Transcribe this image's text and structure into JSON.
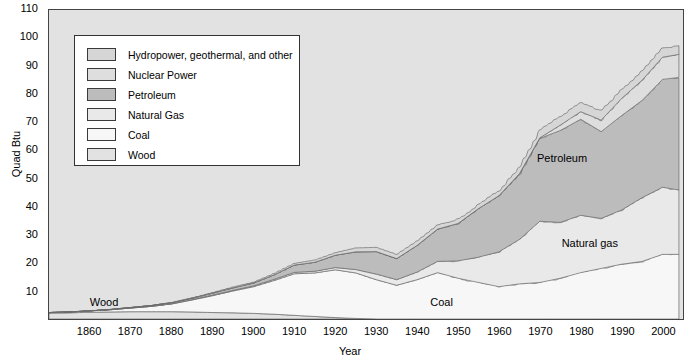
{
  "chart_data": {
    "type": "area",
    "stacked": true,
    "title": "",
    "xlabel": "Year",
    "ylabel": "Quad Btu",
    "xlim": [
      1850,
      2005
    ],
    "ylim": [
      0,
      110
    ],
    "ytick_labels": [
      "10",
      "20",
      "30",
      "40",
      "50",
      "60",
      "70",
      "80",
      "90",
      "100",
      "110"
    ],
    "ytick_values": [
      10,
      20,
      30,
      40,
      50,
      60,
      70,
      80,
      90,
      100,
      110
    ],
    "xtick_labels": [
      "1860",
      "1870",
      "1880",
      "1890",
      "1900",
      "1910",
      "1920",
      "1930",
      "1940",
      "1950",
      "1960",
      "1970",
      "1980",
      "1990",
      "2000"
    ],
    "xtick_values": [
      1860,
      1870,
      1880,
      1890,
      1900,
      1910,
      1920,
      1930,
      1940,
      1950,
      1960,
      1970,
      1980,
      1990,
      2000
    ],
    "grid": false,
    "legend_position": "upper-left-inside",
    "annotations": [
      {
        "text": "Petroleum",
        "x": 1976,
        "y": 57
      },
      {
        "text": "Natural gas",
        "x": 1982,
        "y": 27
      },
      {
        "text": "Coal",
        "x": 1950,
        "y": 6
      },
      {
        "text": "Wood",
        "x": 1867,
        "y": 6
      }
    ],
    "x": [
      1850,
      1855,
      1860,
      1865,
      1870,
      1875,
      1880,
      1885,
      1890,
      1895,
      1900,
      1905,
      1910,
      1915,
      1920,
      1925,
      1930,
      1935,
      1940,
      1945,
      1950,
      1955,
      1960,
      1965,
      1970,
      1975,
      1980,
      1985,
      1990,
      1995,
      2000,
      2004
    ],
    "series": [
      {
        "name": "Wood",
        "color": "#e2e2e2",
        "values": [
          2.1,
          2.2,
          2.4,
          2.5,
          2.6,
          2.6,
          2.6,
          2.5,
          2.3,
          2.2,
          2.0,
          1.7,
          1.3,
          0.9,
          0.5,
          0.2,
          0.0,
          0.0,
          0.0,
          0.0,
          0.0,
          0.0,
          0.0,
          0.0,
          0.0,
          0.0,
          0.0,
          0.0,
          0.0,
          0.0,
          0.0,
          0.0
        ]
      },
      {
        "name": "Coal",
        "color": "#f7f7f7",
        "values": [
          0.2,
          0.3,
          0.5,
          0.8,
          1.3,
          1.9,
          2.8,
          4.3,
          6.0,
          7.8,
          9.5,
          12.0,
          14.8,
          15.5,
          17.0,
          16.2,
          14.0,
          12.0,
          14.0,
          16.5,
          14.5,
          13.0,
          11.5,
          12.5,
          13.0,
          14.5,
          16.5,
          18.0,
          19.5,
          20.5,
          23.0,
          23.0
        ]
      },
      {
        "name": "Natural Gas",
        "color": "#e9e9e9",
        "values": [
          0.0,
          0.0,
          0.0,
          0.0,
          0.0,
          0.0,
          0.0,
          0.1,
          0.2,
          0.2,
          0.3,
          0.4,
          0.5,
          0.6,
          0.8,
          1.2,
          2.0,
          2.0,
          2.7,
          4.0,
          6.2,
          9.0,
          12.4,
          15.8,
          21.8,
          19.9,
          20.4,
          17.8,
          19.3,
          22.7,
          23.9,
          22.9
        ]
      },
      {
        "name": "Petroleum",
        "color": "#bcbcbc",
        "values": [
          0.0,
          0.0,
          0.0,
          0.1,
          0.2,
          0.3,
          0.4,
          0.5,
          0.7,
          0.9,
          1.0,
          1.6,
          2.6,
          3.2,
          4.4,
          6.3,
          8.0,
          7.5,
          9.5,
          11.5,
          13.3,
          17.3,
          19.9,
          23.2,
          29.5,
          32.7,
          34.2,
          30.9,
          33.6,
          34.6,
          38.4,
          40.1
        ]
      },
      {
        "name": "Nuclear Power",
        "color": "#dedede",
        "values": [
          0.0,
          0.0,
          0.0,
          0.0,
          0.0,
          0.0,
          0.0,
          0.0,
          0.0,
          0.0,
          0.0,
          0.0,
          0.0,
          0.0,
          0.0,
          0.0,
          0.0,
          0.0,
          0.0,
          0.0,
          0.0,
          0.0,
          0.1,
          0.2,
          0.2,
          1.9,
          2.7,
          4.1,
          6.1,
          7.2,
          7.9,
          8.2
        ]
      },
      {
        "name": "Hydropower, geothermal, and other",
        "color": "#d6d6d6",
        "values": [
          0.0,
          0.0,
          0.0,
          0.0,
          0.0,
          0.0,
          0.1,
          0.1,
          0.2,
          0.3,
          0.3,
          0.5,
          0.6,
          0.8,
          0.9,
          1.4,
          1.5,
          1.5,
          1.6,
          1.5,
          1.6,
          1.4,
          1.7,
          2.1,
          2.7,
          3.2,
          3.1,
          3.4,
          3.1,
          3.5,
          3.1,
          3.2
        ]
      }
    ],
    "totals_note": ""
  },
  "legend": {
    "items": [
      {
        "label": "Hydropower, geothermal, and other",
        "color": "#d6d6d6"
      },
      {
        "label": "Nuclear Power",
        "color": "#dedede"
      },
      {
        "label": "Petroleum",
        "color": "#bcbcbc"
      },
      {
        "label": "Natural Gas",
        "color": "#e9e9e9"
      },
      {
        "label": "Coal",
        "color": "#f7f7f7"
      },
      {
        "label": "Wood",
        "color": "#e2e2e2"
      }
    ]
  }
}
